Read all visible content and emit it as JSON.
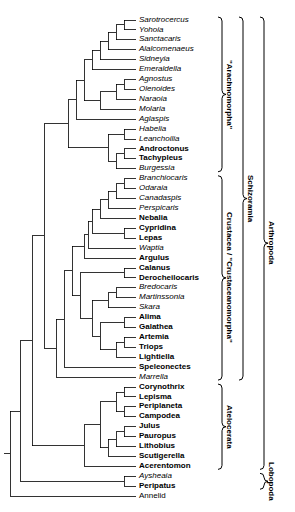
{
  "figure": {
    "kind": "cladogram",
    "width": 295,
    "height": 512,
    "line_color": "#000000",
    "background_color": "#ffffff"
  },
  "taxa": [
    {
      "name": "Sarotrocercus",
      "style": "fossil",
      "y": 20,
      "tip_x": 136
    },
    {
      "name": "Yohoia",
      "style": "fossil",
      "y": 32,
      "tip_x": 136
    },
    {
      "name": "Sanctacaris",
      "style": "fossil",
      "y": 44,
      "tip_x": 136
    },
    {
      "name": "Alalcomenaeus",
      "style": "fossil",
      "y": 56,
      "tip_x": 136
    },
    {
      "name": "Sidneyia",
      "style": "fossil",
      "y": 68,
      "tip_x": 136
    },
    {
      "name": "Emeraldella",
      "style": "fossil",
      "y": 80,
      "tip_x": 136
    },
    {
      "name": "Agnostus",
      "style": "fossil",
      "y": 92,
      "tip_x": 136
    },
    {
      "name": "Olenoides",
      "style": "fossil",
      "y": 104,
      "tip_x": 136
    },
    {
      "name": "Naraoia",
      "style": "fossil",
      "y": 116,
      "tip_x": 136
    },
    {
      "name": "Molaria",
      "style": "fossil",
      "y": 128,
      "tip_x": 136
    },
    {
      "name": "Aglaspis",
      "style": "fossil",
      "y": 140,
      "tip_x": 136
    },
    {
      "name": "Habelia",
      "style": "fossil",
      "y": 152,
      "tip_x": 136
    },
    {
      "name": "Leanchoilia",
      "style": "fossil",
      "y": 164,
      "tip_x": 136
    },
    {
      "name": "Androctonus",
      "style": "extant",
      "y": 176,
      "tip_x": 136
    },
    {
      "name": "Tachypleus",
      "style": "extant",
      "y": 188,
      "tip_x": 136
    },
    {
      "name": "Burgessia",
      "style": "fossil",
      "y": 200,
      "tip_x": 136
    },
    {
      "name": "Branchiocaris",
      "style": "fossil",
      "y": 212,
      "tip_x": 136
    },
    {
      "name": "Odaraia",
      "style": "fossil",
      "y": 224,
      "tip_x": 136
    },
    {
      "name": "Canadaspis",
      "style": "fossil",
      "y": 236,
      "tip_x": 136
    },
    {
      "name": "Perspicaris",
      "style": "fossil",
      "y": 248,
      "tip_x": 136
    },
    {
      "name": "Nebalia",
      "style": "extant",
      "y": 260,
      "tip_x": 136
    },
    {
      "name": "Cypridina",
      "style": "extant",
      "y": 272,
      "tip_x": 136
    },
    {
      "name": "Lepas",
      "style": "extant",
      "y": 284,
      "tip_x": 136
    },
    {
      "name": "Waptia",
      "style": "fossil",
      "y": 296,
      "tip_x": 136
    },
    {
      "name": "Argulus",
      "style": "extant",
      "y": 308,
      "tip_x": 136
    },
    {
      "name": "Calanus",
      "style": "extant",
      "y": 320,
      "tip_x": 136
    },
    {
      "name": "Derocheilocaris",
      "style": "extant",
      "y": 332,
      "tip_x": 136
    },
    {
      "name": "Bredocaris",
      "style": "fossil",
      "y": 344,
      "tip_x": 136
    },
    {
      "name": "Martinssonia",
      "style": "fossil",
      "y": 356,
      "tip_x": 136
    },
    {
      "name": "Skara",
      "style": "fossil",
      "y": 368,
      "tip_x": 136
    },
    {
      "name": "Alima",
      "style": "extant",
      "y": 380,
      "tip_x": 136
    },
    {
      "name": "Galathea",
      "style": "extant",
      "y": 392,
      "tip_x": 136
    },
    {
      "name": "Artemia",
      "style": "extant",
      "y": 404,
      "tip_x": 136
    },
    {
      "name": "Triops",
      "style": "extant",
      "y": 416,
      "tip_x": 136
    },
    {
      "name": "Lightiella",
      "style": "extant",
      "y": 428,
      "tip_x": 136
    },
    {
      "name": "Speleonectes",
      "style": "extant",
      "y": 440,
      "tip_x": 136
    },
    {
      "name": "Marrella",
      "style": "fossil",
      "y": 452,
      "tip_x": 136
    },
    {
      "name": "Corynothrix",
      "style": "extant",
      "y": 464,
      "tip_x": 136
    },
    {
      "name": "Lepisma",
      "style": "extant",
      "y": 476,
      "tip_x": 136
    },
    {
      "name": "Periplaneta",
      "style": "extant",
      "y": 488,
      "tip_x": 136
    },
    {
      "name": "Campodea",
      "style": "extant",
      "y": 500,
      "tip_x": 136
    },
    {
      "name": "Julus",
      "style": "extant",
      "y": 512,
      "tip_x": 136
    },
    {
      "name": "Pauropus",
      "style": "extant",
      "y": 524,
      "tip_x": 136
    },
    {
      "name": "Lithobius",
      "style": "extant",
      "y": 536,
      "tip_x": 136
    },
    {
      "name": "Scutigerella",
      "style": "extant",
      "y": 548,
      "tip_x": 136
    },
    {
      "name": "Acerentomon",
      "style": "extant",
      "y": 560,
      "tip_x": 136
    },
    {
      "name": "Aysheaia",
      "style": "fossil",
      "y": 572,
      "tip_x": 136
    },
    {
      "name": "Peripatus",
      "style": "extant",
      "y": 584,
      "tip_x": 136
    },
    {
      "name": "Annelid",
      "style": "outgroup",
      "y": 596,
      "tip_x": 136
    }
  ],
  "clades": [
    {
      "label": "\"Arachnomorpha\"",
      "level": 1,
      "first": 0,
      "last": 15
    },
    {
      "label": "Crustacea / \"Crustaceanomorpha\"",
      "level": 1,
      "first": 16,
      "last": 36
    },
    {
      "label": "Atelocerata",
      "level": 1,
      "first": 37,
      "last": 45
    },
    {
      "label": "Schizoramia",
      "level": 2,
      "first": 0,
      "last": 36
    },
    {
      "label": "Arthropoda",
      "level": 3,
      "first": 0,
      "last": 45
    },
    {
      "label": "Lobopoda",
      "level": 3,
      "first": 46,
      "last": 47
    }
  ]
}
